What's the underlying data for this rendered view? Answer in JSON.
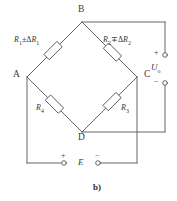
{
  "figure": {
    "caption": "b)",
    "type": "wheatstone-bridge-circuit"
  },
  "nodes": [
    {
      "id": "B",
      "label": "B"
    },
    {
      "id": "A",
      "label": "A"
    },
    {
      "id": "C",
      "label": "C"
    },
    {
      "id": "D",
      "label": "D"
    }
  ],
  "resistors": {
    "r1": {
      "name": "R",
      "sub": "1",
      "op": "±",
      "delta": "Δ",
      "delta_name": "R",
      "delta_sub": "1"
    },
    "r2": {
      "name": "R",
      "sub": "2",
      "op": "∓",
      "delta": "Δ",
      "delta_name": "R",
      "delta_sub": "2"
    },
    "r3": {
      "name": "R",
      "sub": "3"
    },
    "r4": {
      "name": "R",
      "sub": "4"
    }
  },
  "output": {
    "label": "U",
    "sub": "o",
    "plus": "+",
    "minus": "−"
  },
  "source": {
    "label": "E",
    "plus": "+",
    "minus": "−"
  },
  "colors": {
    "line": "#555555",
    "text": "#3a3a3a",
    "background": "#ffffff"
  }
}
